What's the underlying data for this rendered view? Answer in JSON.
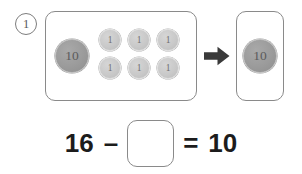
{
  "worksheet": {
    "problem_number": "1",
    "left_panel": {
      "name": "ten-and-ones-group",
      "ten_coins": [
        {
          "label": "10",
          "value": 10
        }
      ],
      "one_coins": [
        {
          "label": "1",
          "value": 1
        },
        {
          "label": "1",
          "value": 1
        },
        {
          "label": "1",
          "value": 1
        },
        {
          "label": "1",
          "value": 1
        },
        {
          "label": "1",
          "value": 1
        },
        {
          "label": "1",
          "value": 1
        }
      ],
      "total": 16
    },
    "arrow": {
      "icon": "arrow-right-icon",
      "direction": "right"
    },
    "right_panel": {
      "name": "remaining-group",
      "ten_coins": [
        {
          "label": "10",
          "value": 10
        }
      ],
      "one_coins": [],
      "total": 10
    },
    "equation": {
      "minuend": "16",
      "operator_minus": "–",
      "answer_box_value": "",
      "answer_box_placeholder": "",
      "operator_equals": "=",
      "result": "10"
    },
    "colors": {
      "panel_border": "#8a8a8a",
      "ten_coin_fill": "#9b9b9b",
      "ten_coin_text": "#5b5b5b",
      "one_coin_fill": "#c9c9c9",
      "one_coin_text": "#6e6e6e",
      "arrow_fill": "#3a3a3a",
      "equation_text": "#1c1c1c",
      "problem_number_border": "#7d7d7d",
      "background": "#ffffff"
    }
  }
}
